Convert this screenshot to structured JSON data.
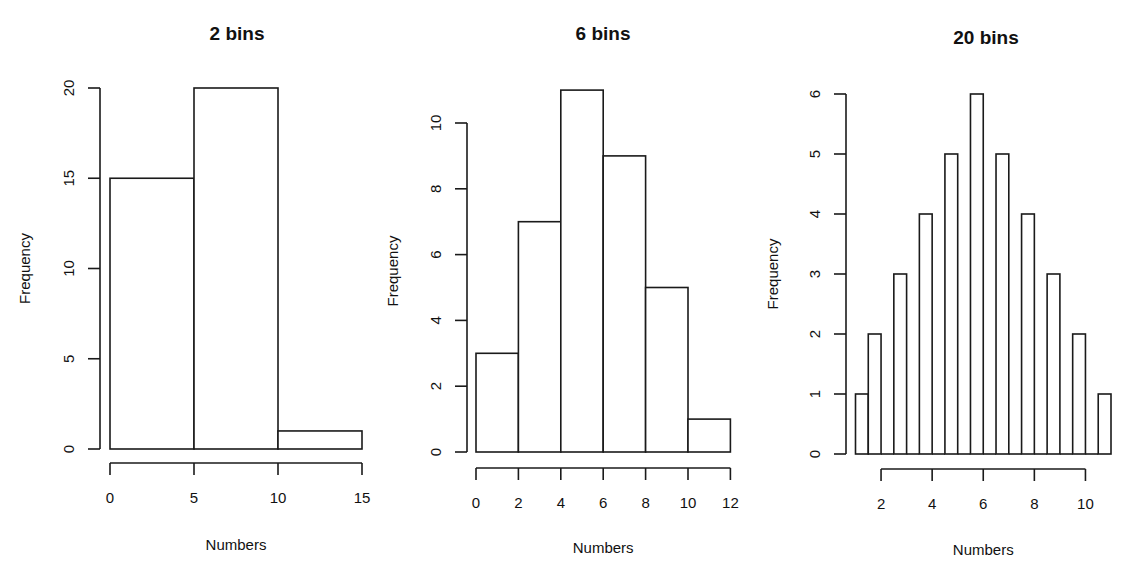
{
  "figure": {
    "background": "#ffffff",
    "bar_fill": "#ffffff",
    "bar_stroke": "#1a1a1a"
  },
  "chart_data": [
    {
      "type": "bar",
      "subtype": "histogram",
      "title": "2 bins",
      "xlabel": "Numbers",
      "ylabel": "Frequency",
      "bin_edges": [
        0,
        5,
        10,
        15
      ],
      "values": [
        15,
        20,
        1
      ],
      "xlim": [
        0,
        15
      ],
      "ylim": [
        0,
        20
      ],
      "x_ticks": [
        0,
        5,
        10,
        15
      ],
      "y_ticks": [
        0,
        5,
        10,
        15,
        20
      ],
      "grid": false,
      "legend": null,
      "layout": {
        "x0_px": 110,
        "x_px_per_unit": 16.8,
        "y0_px": 449,
        "y_px_per_unit": 18.05,
        "yaxis_px": 100,
        "xaxis_px": 463,
        "title_x": 237,
        "title_y": 40,
        "xlabel_y": 550,
        "ylabel_x": 30
      }
    },
    {
      "type": "bar",
      "subtype": "histogram",
      "title": "6 bins",
      "xlabel": "Numbers",
      "ylabel": "Frequency",
      "bin_edges": [
        0,
        2,
        4,
        6,
        8,
        10,
        12
      ],
      "values": [
        3,
        7,
        11,
        9,
        5,
        1
      ],
      "xlim": [
        0,
        12
      ],
      "ylim": [
        0,
        11
      ],
      "x_ticks": [
        0,
        2,
        4,
        6,
        8,
        10,
        12
      ],
      "y_ticks": [
        0,
        2,
        4,
        6,
        8,
        10
      ],
      "grid": false,
      "legend": null,
      "layout": {
        "x0_px": 476,
        "x_px_per_unit": 21.2,
        "y0_px": 452,
        "y_px_per_unit": 32.9,
        "yaxis_px": 467,
        "xaxis_px": 468,
        "title_x": 603,
        "title_y": 40,
        "xlabel_y": 553,
        "ylabel_x": 398
      }
    },
    {
      "type": "bar",
      "subtype": "histogram",
      "title": "20 bins",
      "xlabel": "Numbers",
      "ylabel": "Frequency",
      "bin_edges": [
        1,
        1.5,
        2,
        2.5,
        3,
        3.5,
        4,
        4.5,
        5,
        5.5,
        6,
        6.5,
        7,
        7.5,
        8,
        8.5,
        9,
        9.5,
        10,
        10.5,
        11
      ],
      "values": [
        1,
        2,
        0,
        3,
        0,
        4,
        0,
        5,
        0,
        6,
        0,
        5,
        0,
        4,
        0,
        3,
        0,
        2,
        0,
        1
      ],
      "xlim": [
        1,
        11
      ],
      "ylim": [
        0,
        6
      ],
      "x_ticks": [
        2,
        4,
        6,
        8,
        10
      ],
      "y_ticks": [
        0,
        1,
        2,
        3,
        4,
        5,
        6
      ],
      "grid": false,
      "legend": null,
      "layout": {
        "x0_px": 855.5,
        "x_px_per_unit": 25.55,
        "y0_px": 454,
        "y_px_per_unit": 60,
        "yaxis_px": 846,
        "xaxis_px": 469,
        "title_x": 986,
        "title_y": 44,
        "xlabel_y": 555,
        "ylabel_x": 778
      }
    }
  ]
}
